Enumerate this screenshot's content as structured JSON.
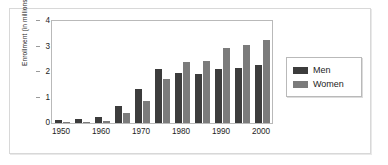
{
  "chart_data": {
    "type": "bar",
    "title": "",
    "subtitle": "",
    "xlabel": "",
    "ylabel": "Enrollment (in millions)",
    "ylim": [
      0,
      4
    ],
    "yticks": [
      0,
      1,
      2,
      3,
      4
    ],
    "ytick_labels": [
      "0",
      "1",
      "2",
      "3",
      "4"
    ],
    "grid": false,
    "legend_position": "right",
    "categories": [
      "1950",
      "1955",
      "1960",
      "1965",
      "1970",
      "1975",
      "1980",
      "1985",
      "1990",
      "1995",
      "2000"
    ],
    "xtick_labels": [
      "1950",
      "1960",
      "1970",
      "1980",
      "1990",
      "2000"
    ],
    "xtick_categories": [
      "1950",
      "1960",
      "1970",
      "1980",
      "1990",
      "2000"
    ],
    "series": [
      {
        "name": "Men",
        "color": "#3c3c3c",
        "values": [
          0.1,
          0.15,
          0.23,
          0.67,
          1.32,
          2.1,
          1.96,
          1.91,
          2.11,
          2.15,
          2.26
        ]
      },
      {
        "name": "Women",
        "color": "#7b7b7b",
        "values": [
          0.03,
          0.05,
          0.08,
          0.39,
          0.88,
          1.71,
          2.38,
          2.42,
          2.93,
          3.04,
          3.26
        ]
      }
    ]
  },
  "legend": {
    "entries": [
      {
        "label": "Men",
        "color": "#3c3c3c"
      },
      {
        "label": "Women",
        "color": "#7b7b7b"
      }
    ]
  }
}
